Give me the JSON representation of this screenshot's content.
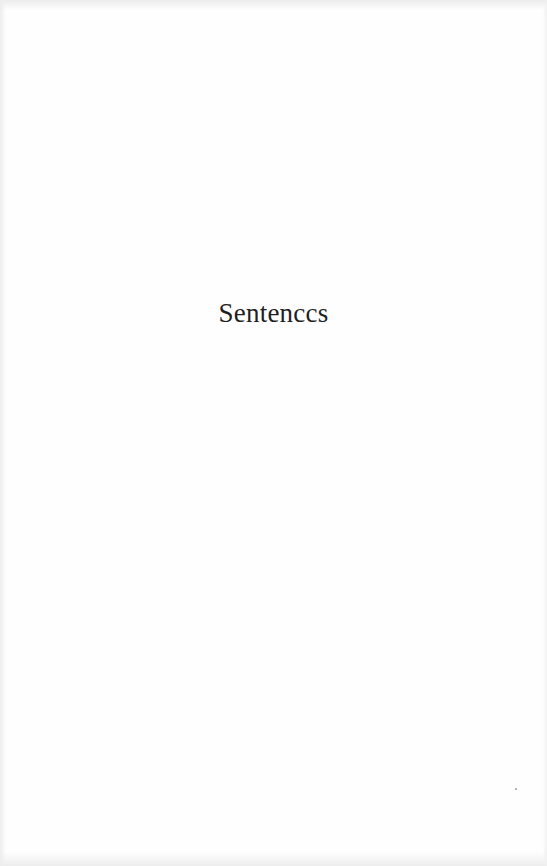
{
  "page": {
    "heading": "Sentenccs"
  }
}
